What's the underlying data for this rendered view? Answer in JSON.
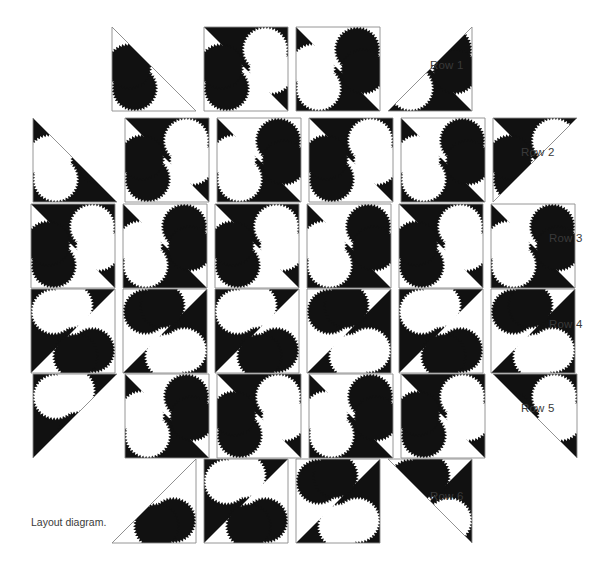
{
  "figure": {
    "caption": "Layout diagram.",
    "kind": "quilt-layout-diagram",
    "colors": {
      "fabric_dark": "#111111",
      "fabric_light": "#ffffff",
      "block_outline": "#8a8a8a",
      "text": "#3a3a3a",
      "background": "#ffffff"
    }
  },
  "geometry": {
    "block_size": 84,
    "pitch": 92,
    "circle_radius_ratio": 0.255,
    "scallop_teeth": 44,
    "scallop_depth": 2.1
  },
  "row_labels": [
    {
      "text": "Row 1",
      "x": 430,
      "y": 59
    },
    {
      "text": "Row 2",
      "x": 521,
      "y": 146
    },
    {
      "text": "Row 3",
      "x": 549,
      "y": 232
    },
    {
      "text": "Row 4",
      "x": 549,
      "y": 318
    },
    {
      "text": "Row 5",
      "x": 521,
      "y": 402
    },
    {
      "text": "Row 6",
      "x": 430,
      "y": 490
    }
  ],
  "rows": [
    {
      "name": "Row 1",
      "y": 27,
      "x_start": 112,
      "units": [
        {
          "shape": "triangle",
          "hyp": "tl-br",
          "solid_side": "bottom-left",
          "diag": "main",
          "dark_half": "upper",
          "variant": "A"
        },
        {
          "shape": "square",
          "diag": "main",
          "dark_half": "upper",
          "variant": "A"
        },
        {
          "shape": "square",
          "diag": "main",
          "dark_half": "lower",
          "variant": "B"
        },
        {
          "shape": "triangle",
          "hyp": "tr-bl",
          "solid_side": "bottom-left",
          "diag": "main",
          "dark_half": "lower",
          "variant": "B"
        }
      ]
    },
    {
      "name": "Row 2",
      "y": 118,
      "x_start": 33,
      "units": [
        {
          "shape": "triangle",
          "hyp": "tl-br",
          "solid_side": "bottom-left",
          "diag": "main",
          "dark_half": "lower",
          "variant": "B"
        },
        {
          "shape": "square",
          "diag": "main",
          "dark_half": "upper",
          "variant": "A"
        },
        {
          "shape": "square",
          "diag": "main",
          "dark_half": "lower",
          "variant": "B"
        },
        {
          "shape": "square",
          "diag": "main",
          "dark_half": "upper",
          "variant": "A"
        },
        {
          "shape": "square",
          "diag": "main",
          "dark_half": "lower",
          "variant": "B"
        },
        {
          "shape": "triangle",
          "hyp": "tr-bl",
          "solid_side": "top-left",
          "diag": "main",
          "dark_half": "upper",
          "variant": "A"
        }
      ]
    },
    {
      "name": "Row 3",
      "y": 204,
      "x_start": 31,
      "units": [
        {
          "shape": "square",
          "diag": "main",
          "dark_half": "upper",
          "variant": "A"
        },
        {
          "shape": "square",
          "diag": "main",
          "dark_half": "lower",
          "variant": "B"
        },
        {
          "shape": "square",
          "diag": "main",
          "dark_half": "upper",
          "variant": "A"
        },
        {
          "shape": "square",
          "diag": "main",
          "dark_half": "lower",
          "variant": "B"
        },
        {
          "shape": "square",
          "diag": "main",
          "dark_half": "upper",
          "variant": "A"
        },
        {
          "shape": "square",
          "diag": "main",
          "dark_half": "lower",
          "variant": "B"
        }
      ]
    },
    {
      "name": "Row 4",
      "y": 289,
      "x_start": 31,
      "units": [
        {
          "shape": "square",
          "diag": "anti",
          "dark_half": "upper",
          "variant": "C"
        },
        {
          "shape": "square",
          "diag": "anti",
          "dark_half": "lower",
          "variant": "D"
        },
        {
          "shape": "square",
          "diag": "anti",
          "dark_half": "upper",
          "variant": "C"
        },
        {
          "shape": "square",
          "diag": "anti",
          "dark_half": "lower",
          "variant": "D"
        },
        {
          "shape": "square",
          "diag": "anti",
          "dark_half": "upper",
          "variant": "C"
        },
        {
          "shape": "square",
          "diag": "anti",
          "dark_half": "lower",
          "variant": "D"
        }
      ]
    },
    {
      "name": "Row 5",
      "y": 374,
      "x_start": 33,
      "units": [
        {
          "shape": "triangle",
          "hyp": "tr-bl",
          "solid_side": "top-left",
          "diag": "anti",
          "dark_half": "upper",
          "variant": "C"
        },
        {
          "shape": "square",
          "diag": "main",
          "dark_half": "lower",
          "variant": "B"
        },
        {
          "shape": "square",
          "diag": "main",
          "dark_half": "upper",
          "variant": "A"
        },
        {
          "shape": "square",
          "diag": "main",
          "dark_half": "lower",
          "variant": "B"
        },
        {
          "shape": "square",
          "diag": "main",
          "dark_half": "upper",
          "variant": "A"
        },
        {
          "shape": "triangle",
          "hyp": "tl-br",
          "solid_side": "top-left",
          "diag": "main",
          "dark_half": "upper",
          "variant": "A"
        }
      ]
    },
    {
      "name": "Row 6",
      "y": 459,
      "x_start": 112,
      "units": [
        {
          "shape": "triangle",
          "hyp": "tr-bl",
          "solid_side": "top-right",
          "diag": "anti",
          "dark_half": "upper",
          "variant": "C"
        },
        {
          "shape": "square",
          "diag": "anti",
          "dark_half": "upper",
          "variant": "C"
        },
        {
          "shape": "square",
          "diag": "anti",
          "dark_half": "lower",
          "variant": "D"
        },
        {
          "shape": "triangle",
          "hyp": "tl-br",
          "solid_side": "top-left",
          "diag": "anti",
          "dark_half": "lower",
          "variant": "D"
        }
      ]
    }
  ]
}
